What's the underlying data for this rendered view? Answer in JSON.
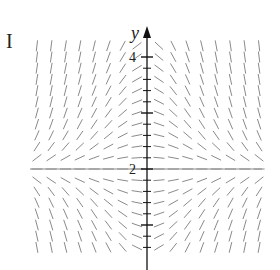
{
  "panel": {
    "label": "I"
  },
  "axis": {
    "y_label": "y",
    "tick_labels": [
      {
        "value": 4,
        "text": "4"
      },
      {
        "value": 2,
        "text": "2"
      }
    ],
    "major_ticks": [
      1,
      2,
      3,
      4
    ]
  },
  "slope_field": {
    "equation_shape": "dy/dx proportional to -x(y-2)",
    "equilibrium_y": 2,
    "x_columns": 16,
    "y_range": [
      0.6,
      4.2
    ],
    "row_step": 0.2,
    "colors": {
      "segment": "#8a8a8a",
      "axis": "#111111"
    }
  }
}
